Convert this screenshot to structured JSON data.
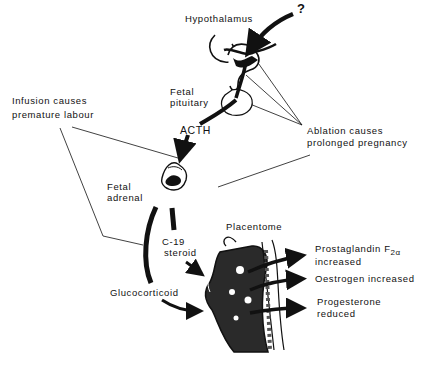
{
  "diagram": {
    "title": "",
    "colors": {
      "ink": "#111111",
      "background": "#ffffff",
      "tissue_gray": "#555555"
    },
    "nodes": {
      "question": {
        "label": "?"
      },
      "hypothalamus": {
        "label": "Hypothalamus"
      },
      "fetal_pituitary": {
        "line1": "Fetal",
        "line2": "pituitary"
      },
      "acth": {
        "label": "ACTH"
      },
      "fetal_adrenal": {
        "line1": "Fetal",
        "line2": "adrenal"
      },
      "c19_steroid": {
        "line1": "C-19",
        "line2": "steroid"
      },
      "glucocorticoid": {
        "label": "Glucocorticoid"
      },
      "placentome": {
        "label": "Placentome"
      }
    },
    "annotations": {
      "infusion": {
        "line1": "Infusion  causes",
        "line2": "premature  labour"
      },
      "ablation": {
        "line1": "Ablation  causes",
        "line2": "prolonged  pregnancy"
      }
    },
    "outcomes": [
      {
        "line1": "Prostaglandin  F",
        "subscript": "2α",
        "line2": "increased"
      },
      {
        "line1": "Oestrogen  increased"
      },
      {
        "line1": "Progesterone",
        "line2": "reduced"
      }
    ],
    "edges": [
      {
        "from": "?",
        "to": "Hypothalamus"
      },
      {
        "from": "Hypothalamus",
        "to": "Fetal pituitary"
      },
      {
        "from": "Fetal pituitary",
        "to": "Fetal adrenal",
        "label": "ACTH"
      },
      {
        "from": "Fetal adrenal",
        "to": "Placentome",
        "label": "C-19 steroid"
      },
      {
        "from": "Fetal adrenal",
        "to": "Placentome",
        "label": "Glucocorticoid"
      },
      {
        "from": "Placentome",
        "to": "Prostaglandin F2α increased"
      },
      {
        "from": "Placentome",
        "to": "Oestrogen increased"
      },
      {
        "from": "Placentome",
        "to": "Progesterone reduced"
      }
    ]
  }
}
